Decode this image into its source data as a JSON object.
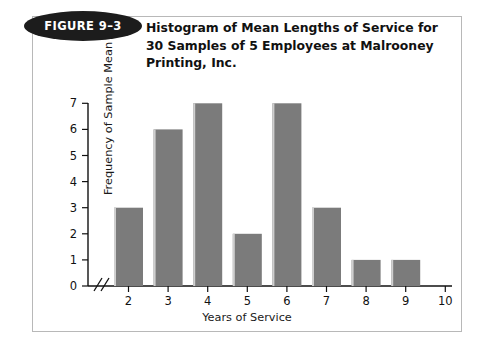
{
  "figure": {
    "badge_label": "FIGURE 9–3",
    "title": "Histogram of Mean Lengths of Service for 30 Samples of 5 Employees at Malrooney Printing, Inc.",
    "border_color": "#b8b8b8",
    "badge_color": "#1c1c1c",
    "badge_text_color": "#ffffff"
  },
  "chart_data": {
    "type": "bar",
    "title": "Histogram of Mean Lengths of Service for 30 Samples of 5 Employees at Malrooney Printing, Inc.",
    "xlabel": "Years of Service",
    "ylabel": "Frequency of Sample Mean",
    "categories": [
      "2",
      "3",
      "4",
      "5",
      "6",
      "7",
      "8",
      "9",
      "10"
    ],
    "values": [
      3,
      6,
      7,
      2,
      7,
      3,
      1,
      1,
      0
    ],
    "xtick_labels": [
      "2",
      "3",
      "4",
      "5",
      "6",
      "7",
      "8",
      "9",
      "10"
    ],
    "ytick_labels": [
      "0",
      "1",
      "2",
      "3",
      "4",
      "5",
      "6",
      "7"
    ],
    "ylim": [
      0,
      7
    ],
    "grid": false,
    "legend": null,
    "bar_color": "#7b7b7b",
    "axis_break": "//",
    "total_samples": 30
  }
}
